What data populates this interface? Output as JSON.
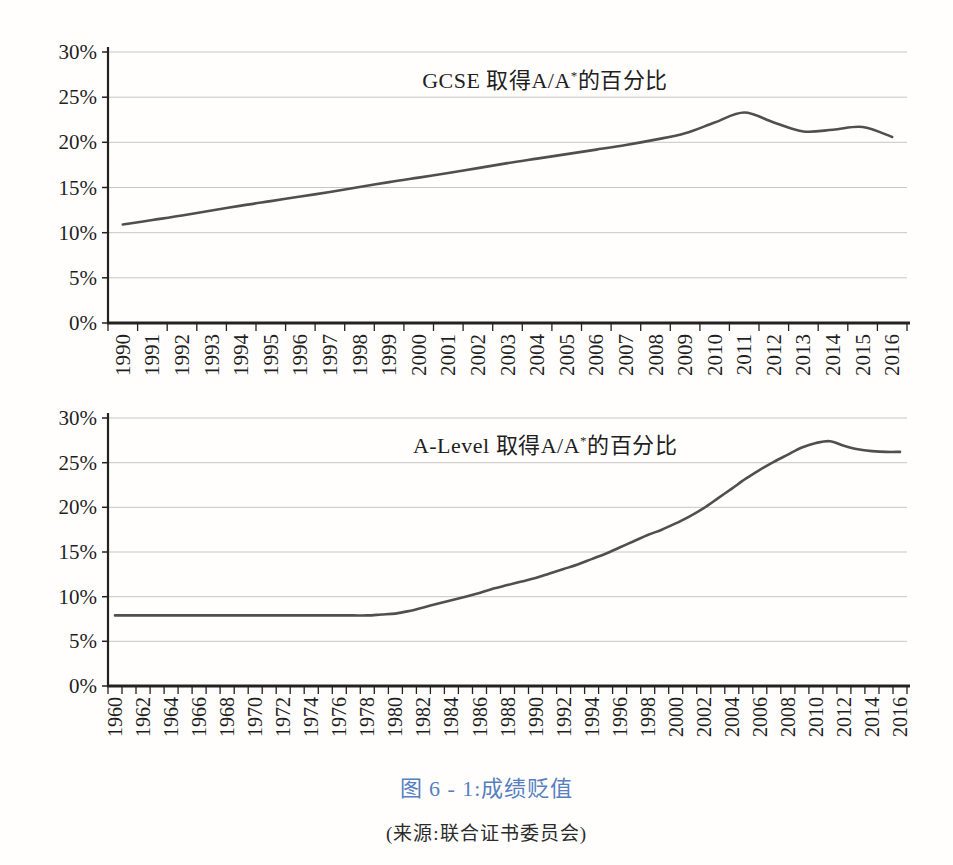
{
  "colors": {
    "caption": "#5580bf",
    "line": "#4f4f4f",
    "grid": "#c6c6c6",
    "axis": "#222222",
    "text": "#1f1f1f"
  },
  "caption": {
    "text": "图 6 - 1:成绩贬值"
  },
  "source": {
    "text": "(来源:联合证书委员会)"
  },
  "chart_data": [
    {
      "type": "line",
      "name": "gcse",
      "title_prefix": "GCSE 取得A/A",
      "title_sup": "*",
      "title_suffix": "的百分比",
      "ylim": [
        0,
        30
      ],
      "grid": true,
      "legend": "none",
      "y_ticks": [
        {
          "value": 0,
          "label": "0%"
        },
        {
          "value": 5,
          "label": "5%"
        },
        {
          "value": 10,
          "label": "10%"
        },
        {
          "value": 15,
          "label": "15%"
        },
        {
          "value": 20,
          "label": "20%"
        },
        {
          "value": 25,
          "label": "25%"
        },
        {
          "value": 30,
          "label": "30%"
        }
      ],
      "years": [
        1990,
        1991,
        1992,
        1993,
        1994,
        1995,
        1996,
        1997,
        1998,
        1999,
        2000,
        2001,
        2002,
        2003,
        2004,
        2005,
        2006,
        2007,
        2008,
        2009,
        2010,
        2011,
        2012,
        2013,
        2014,
        2015,
        2016
      ],
      "values": [
        10.9,
        11.4,
        11.9,
        12.45,
        13.0,
        13.5,
        14.0,
        14.5,
        15.05,
        15.6,
        16.1,
        16.6,
        17.15,
        17.7,
        18.2,
        18.7,
        19.2,
        19.7,
        20.3,
        21.0,
        22.2,
        23.3,
        22.2,
        21.2,
        21.4,
        21.7,
        20.6
      ],
      "x_tick_labels": [
        "1990",
        "1991",
        "1992",
        "1993",
        "1994",
        "1995",
        "1996",
        "1997",
        "1998",
        "1999",
        "2000",
        "2001",
        "2002",
        "2003",
        "2004",
        "2005",
        "2006",
        "2007",
        "2008",
        "2009",
        "2010",
        "2011",
        "2012",
        "2013",
        "2014",
        "2015",
        "2016"
      ]
    },
    {
      "type": "line",
      "name": "alevel",
      "title_prefix": "A-Level 取得A/A",
      "title_sup": "*",
      "title_suffix": "的百分比",
      "ylim": [
        0,
        30
      ],
      "grid": true,
      "legend": "none",
      "y_ticks": [
        {
          "value": 0,
          "label": "0%"
        },
        {
          "value": 5,
          "label": "5%"
        },
        {
          "value": 10,
          "label": "10%"
        },
        {
          "value": 15,
          "label": "15%"
        },
        {
          "value": 20,
          "label": "20%"
        },
        {
          "value": 25,
          "label": "25%"
        },
        {
          "value": 30,
          "label": "30%"
        }
      ],
      "years": [
        1960,
        1961,
        1962,
        1963,
        1964,
        1965,
        1966,
        1967,
        1968,
        1969,
        1970,
        1971,
        1972,
        1973,
        1974,
        1975,
        1976,
        1977,
        1978,
        1979,
        1980,
        1981,
        1982,
        1983,
        1984,
        1985,
        1986,
        1987,
        1988,
        1989,
        1990,
        1991,
        1992,
        1993,
        1994,
        1995,
        1996,
        1997,
        1998,
        1999,
        2000,
        2001,
        2002,
        2003,
        2004,
        2005,
        2006,
        2007,
        2008,
        2009,
        2010,
        2011,
        2012,
        2013,
        2014,
        2015,
        2016
      ],
      "values": [
        7.9,
        7.9,
        7.9,
        7.9,
        7.9,
        7.9,
        7.9,
        7.9,
        7.9,
        7.9,
        7.9,
        7.9,
        7.9,
        7.9,
        7.9,
        7.9,
        7.9,
        7.9,
        7.9,
        8.0,
        8.1,
        8.4,
        8.8,
        9.2,
        9.6,
        10.0,
        10.4,
        10.9,
        11.3,
        11.7,
        12.1,
        12.6,
        13.1,
        13.6,
        14.2,
        14.8,
        15.5,
        16.2,
        16.9,
        17.5,
        18.2,
        19.0,
        19.9,
        21.0,
        22.1,
        23.2,
        24.2,
        25.1,
        25.9,
        26.7,
        27.2,
        27.4,
        26.9,
        26.5,
        26.3,
        26.2,
        26.2
      ],
      "x_tick_labels": [
        "1960",
        "1962",
        "1964",
        "1966",
        "1968",
        "1970",
        "1972",
        "1974",
        "1976",
        "1978",
        "1980",
        "1982",
        "1984",
        "1986",
        "1988",
        "1990",
        "1992",
        "1994",
        "1996",
        "1998",
        "2000",
        "2002",
        "2004",
        "2006",
        "2008",
        "2010",
        "2012",
        "2014",
        "2016"
      ]
    }
  ]
}
